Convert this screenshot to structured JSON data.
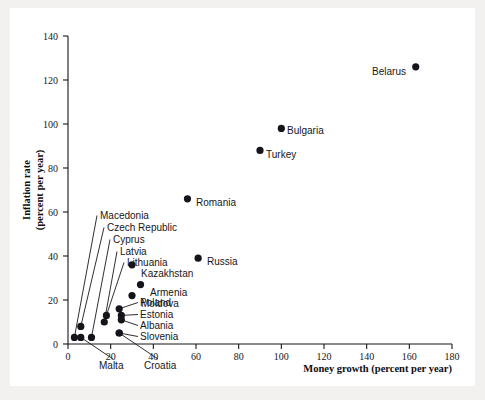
{
  "chart_data": {
    "type": "scatter",
    "title": "",
    "xlabel": "Money growth (percent per year)",
    "ylabel": "Inflation rate (percent per year)",
    "ylabel_line1": "Inflation rate",
    "ylabel_line2": "(percent per year)",
    "xlim": [
      0,
      180
    ],
    "ylim": [
      0,
      140
    ],
    "xticks": [
      0,
      20,
      40,
      60,
      80,
      100,
      120,
      140,
      160,
      180
    ],
    "yticks": [
      0,
      20,
      40,
      60,
      80,
      100,
      120,
      140
    ],
    "grid": false,
    "legend": "none",
    "marker": "filled-circle",
    "marker_color": "#15141a",
    "background": "#ffffff",
    "points": [
      {
        "name": "Belarus",
        "x": 163,
        "y": 126,
        "label_pos": "left"
      },
      {
        "name": "Bulgaria",
        "x": 100,
        "y": 98,
        "label_pos": "right"
      },
      {
        "name": "Turkey",
        "x": 90,
        "y": 88,
        "label_pos": "right"
      },
      {
        "name": "Romania",
        "x": 56,
        "y": 66,
        "label_pos": "right"
      },
      {
        "name": "Russia",
        "x": 61,
        "y": 39,
        "label_pos": "right"
      },
      {
        "name": "Kazakhstan",
        "x": 30,
        "y": 36,
        "label_pos": "right"
      },
      {
        "name": "Armenia",
        "x": 34,
        "y": 27,
        "label_pos": "right"
      },
      {
        "name": "Moldova",
        "x": 30,
        "y": 22,
        "label_pos": "right"
      },
      {
        "name": "Poland",
        "x": 24,
        "y": 16,
        "label_pos": "leader"
      },
      {
        "name": "Estonia",
        "x": 25,
        "y": 13,
        "label_pos": "leader"
      },
      {
        "name": "Albania",
        "x": 25,
        "y": 11,
        "label_pos": "leader"
      },
      {
        "name": "Slovenia",
        "x": 24,
        "y": 5,
        "label_pos": "leader"
      },
      {
        "name": "Lithuania",
        "x": 18,
        "y": 13,
        "label_pos": "leader"
      },
      {
        "name": "Latvia",
        "x": 17,
        "y": 10,
        "label_pos": "leader"
      },
      {
        "name": "Cyprus",
        "x": 11,
        "y": 3,
        "label_pos": "leader"
      },
      {
        "name": "Czech Republic",
        "x": 6,
        "y": 8,
        "label_pos": "leader"
      },
      {
        "name": "Macedonia",
        "x": 3,
        "y": 3,
        "label_pos": "leader"
      },
      {
        "name": "Malta",
        "x": 6,
        "y": 3,
        "label_pos": "leader-below"
      },
      {
        "name": "Croatia",
        "x": 24,
        "y": 5,
        "label_pos": "leader-below"
      }
    ],
    "callout_labels": [
      {
        "text": "Macedonia",
        "x": 100,
        "y": 219
      },
      {
        "text": "Czech Republic",
        "x": 107,
        "y": 231
      },
      {
        "text": "Cyprus",
        "x": 113,
        "y": 243
      },
      {
        "text": "Latvia",
        "x": 120,
        "y": 255
      },
      {
        "text": "Lithuania",
        "x": 127,
        "y": 266
      },
      {
        "text": "Poland",
        "x": 140,
        "y": 306
      },
      {
        "text": "Estonia",
        "x": 140,
        "y": 318
      },
      {
        "text": "Albania",
        "x": 140,
        "y": 329
      },
      {
        "text": "Slovenia",
        "x": 140,
        "y": 340
      },
      {
        "text": "Malta",
        "x": 99,
        "y": 369
      },
      {
        "text": "Croatia",
        "x": 144,
        "y": 369
      }
    ],
    "inline_labels": [
      {
        "text": "Belarus",
        "x": 406,
        "y": 75,
        "anchor": "end"
      },
      {
        "text": "Bulgaria",
        "x": 287,
        "y": 134,
        "anchor": "start"
      },
      {
        "text": "Turkey",
        "x": 266,
        "y": 158,
        "anchor": "start"
      },
      {
        "text": "Romania",
        "x": 196,
        "y": 206,
        "anchor": "start"
      },
      {
        "text": "Russia",
        "x": 207,
        "y": 265,
        "anchor": "start"
      },
      {
        "text": "Kazakhstan",
        "x": 141,
        "y": 277,
        "anchor": "start"
      },
      {
        "text": "Armenia",
        "x": 150,
        "y": 296,
        "anchor": "start"
      },
      {
        "text": "Moldova",
        "x": 141,
        "y": 307,
        "anchor": "start"
      }
    ]
  }
}
